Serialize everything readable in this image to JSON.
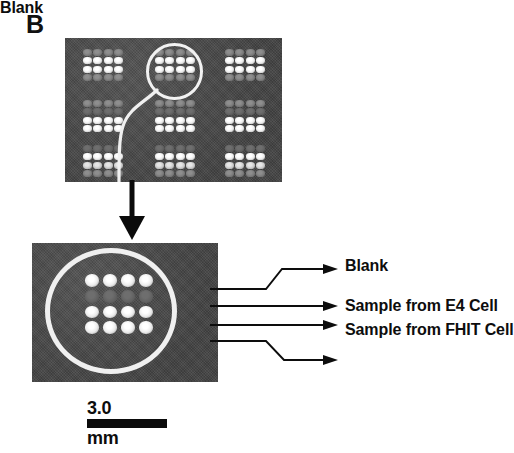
{
  "figure": {
    "panel_label": "B",
    "background_color": "#ffffff",
    "panel_color": "#4a4a4a",
    "spot_bright_color": "#ffffff",
    "spot_dim_color": "#8e8e8e",
    "annotation_color": "#0d0d0d",
    "highlight_circle_color": "#f0f0f0"
  },
  "overview": {
    "name": "microarray-overview",
    "grid_rows": 3,
    "grid_cols": 3,
    "blocks": [
      {
        "id": "block-r1c1",
        "row_intensities": [
          "dim",
          "bright",
          "bright",
          "dim"
        ]
      },
      {
        "id": "block-r1c2",
        "row_intensities": [
          "dim",
          "bright",
          "bright",
          "dim"
        ],
        "highlighted": true
      },
      {
        "id": "block-r1c3",
        "row_intensities": [
          "dim",
          "bright",
          "bright",
          "dim"
        ]
      },
      {
        "id": "block-r2c1",
        "row_intensities": [
          "dim",
          "faint",
          "bright",
          "bright"
        ]
      },
      {
        "id": "block-r2c2",
        "row_intensities": [
          "dim",
          "faint",
          "bright",
          "bright"
        ]
      },
      {
        "id": "block-r2c3",
        "row_intensities": [
          "dim",
          "faint",
          "bright",
          "bright"
        ]
      },
      {
        "id": "block-r3c1",
        "row_intensities": [
          "faint",
          "bright",
          "mid",
          "dim"
        ]
      },
      {
        "id": "block-r3c2",
        "row_intensities": [
          "faint",
          "bright",
          "mid",
          "dim"
        ]
      },
      {
        "id": "block-r3c3",
        "row_intensities": [
          "faint",
          "bright",
          "mid",
          "dim"
        ]
      }
    ]
  },
  "magnified": {
    "name": "microarray-magnified-block",
    "rows": 4,
    "cols": 4,
    "row_intensities": [
      "bright",
      "faint",
      "bright",
      "bright"
    ]
  },
  "callouts": [
    {
      "id": "callout-blank-top",
      "label": "Blank",
      "target_row": 1,
      "leader": "bent-up"
    },
    {
      "id": "callout-e4",
      "label": "Sample from E4 Cell",
      "target_row": 2,
      "leader": "straight"
    },
    {
      "id": "callout-fhit",
      "label": "Sample from FHIT Cell",
      "target_row": 3,
      "leader": "straight"
    },
    {
      "id": "callout-blank-bottom",
      "label": "Blank",
      "target_row": 4,
      "leader": "bent-down"
    }
  ],
  "scalebar": {
    "value": "3.0",
    "unit": "mm"
  }
}
